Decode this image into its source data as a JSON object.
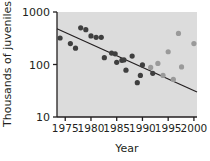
{
  "chart_data": {
    "type": "scatter",
    "title": "",
    "xlabel": "Year",
    "ylabel": "Thousands of juveniles",
    "xlim": [
      1973.4,
      2000.6
    ],
    "ylim": [
      10,
      1000
    ],
    "yscale": "log",
    "grid": false,
    "legend": null,
    "xticks": [
      1975,
      1980,
      1985,
      1990,
      1995,
      2000
    ],
    "xtick_labels": [
      "1975",
      "1980",
      "1985",
      "1990",
      "1995",
      "2000"
    ],
    "yticks": [
      10,
      100,
      1000
    ],
    "ytick_labels": [
      "10",
      "100",
      "1000"
    ],
    "plot_bg_color": "#dcdcdc",
    "figure_bg_color": "#ffffff",
    "axis_color": "#231f20",
    "series": [
      {
        "name": "early-period-observations",
        "marker": "filled-circle",
        "color": "#3f3f3f",
        "points": [
          {
            "x": 1974,
            "y": 320
          },
          {
            "x": 1976,
            "y": 250
          },
          {
            "x": 1977,
            "y": 205
          },
          {
            "x": 1978,
            "y": 500
          },
          {
            "x": 1979,
            "y": 460
          },
          {
            "x": 1980,
            "y": 350
          },
          {
            "x": 1981,
            "y": 330
          },
          {
            "x": 1982,
            "y": 330
          },
          {
            "x": 1982.6,
            "y": 135
          },
          {
            "x": 1984,
            "y": 165
          },
          {
            "x": 1984.7,
            "y": 160
          },
          {
            "x": 1985,
            "y": 110
          },
          {
            "x": 1986,
            "y": 120
          },
          {
            "x": 1986.4,
            "y": 122
          },
          {
            "x": 1986.8,
            "y": 78
          },
          {
            "x": 1988,
            "y": 145
          },
          {
            "x": 1989,
            "y": 45
          },
          {
            "x": 1989.6,
            "y": 62
          },
          {
            "x": 1990,
            "y": 98
          },
          {
            "x": 1992,
            "y": 68
          }
        ]
      },
      {
        "name": "late-period-observations",
        "marker": "filled-circle",
        "color": "#9a9a9a",
        "points": [
          {
            "x": 1991.6,
            "y": 88
          },
          {
            "x": 1993,
            "y": 105
          },
          {
            "x": 1994,
            "y": 62
          },
          {
            "x": 1995,
            "y": 175
          },
          {
            "x": 1996,
            "y": 52
          },
          {
            "x": 1997,
            "y": 390
          },
          {
            "x": 1997.6,
            "y": 90
          },
          {
            "x": 2000,
            "y": 250
          }
        ]
      }
    ],
    "trendline": {
      "name": "regression-trendline",
      "color": "#231f20",
      "x_start": 1973.4,
      "y_start": 480,
      "x_end": 2000.6,
      "y_end": 30
    }
  }
}
